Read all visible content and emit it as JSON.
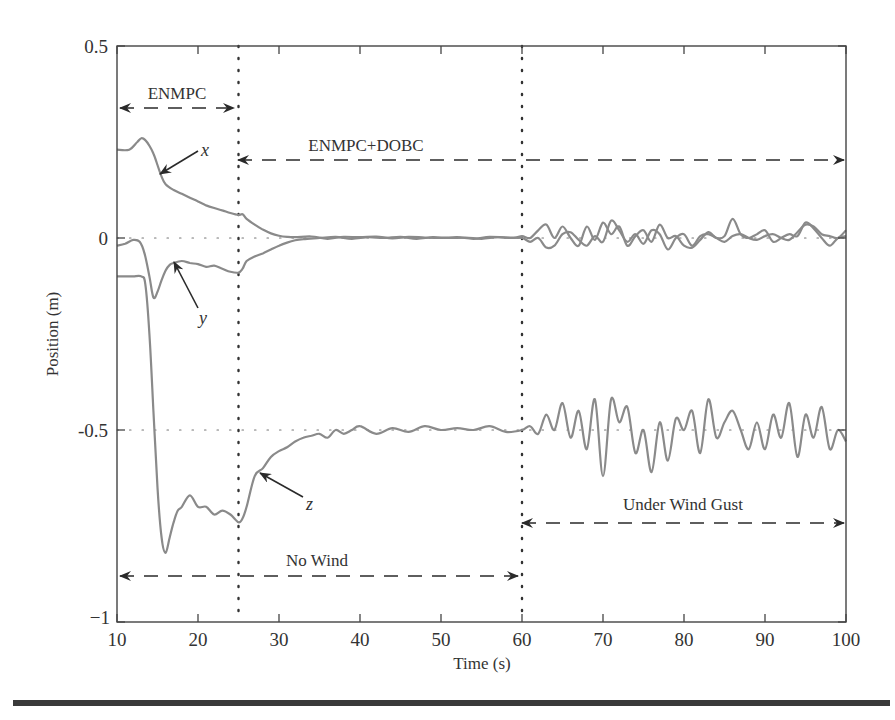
{
  "chart_data": {
    "type": "line",
    "title": "",
    "xlabel": "Time (s)",
    "ylabel": "Position (m)",
    "xlim": [
      10,
      100
    ],
    "ylim": [
      -1,
      0.5
    ],
    "xticks": [
      10,
      20,
      30,
      40,
      50,
      60,
      70,
      80,
      90,
      100
    ],
    "xtick_labels": [
      "10",
      "20",
      "30",
      "40",
      "50",
      "60",
      "70",
      "80",
      "90",
      "100"
    ],
    "yticks": [
      -1,
      -0.5,
      0,
      0.5
    ],
    "ytick_labels": [
      "−1",
      "-0.5",
      "0",
      "0.5"
    ],
    "grid": false,
    "reference_lines": [
      {
        "orientation": "horizontal",
        "value": 0,
        "style": "dotted"
      },
      {
        "orientation": "horizontal",
        "value": -0.5,
        "style": "dotted"
      },
      {
        "orientation": "vertical",
        "value": 25,
        "style": "dotted"
      },
      {
        "orientation": "vertical",
        "value": 60,
        "style": "dotted"
      }
    ],
    "series": [
      {
        "name": "x",
        "color": "#8a8a8a",
        "x": [
          10,
          11.5,
          12.5,
          13,
          13.5,
          14,
          14.5,
          15,
          15.5,
          16,
          17,
          18,
          19,
          20,
          21,
          22,
          23,
          24,
          25,
          25.5,
          26,
          27,
          28,
          29,
          30,
          31,
          32,
          34,
          36,
          38,
          40,
          42,
          44,
          46,
          48,
          50,
          52,
          54,
          56,
          58,
          60,
          61,
          62,
          63,
          64,
          65,
          66,
          67,
          68,
          69,
          70,
          71,
          72,
          73,
          74,
          75,
          76,
          77,
          78,
          79,
          80,
          81,
          82,
          83,
          84,
          85,
          86,
          87,
          88,
          89,
          90,
          91,
          92,
          93,
          94,
          95,
          96,
          97,
          98,
          99,
          100
        ],
        "values": [
          0.23,
          0.23,
          0.25,
          0.26,
          0.255,
          0.24,
          0.22,
          0.19,
          0.16,
          0.14,
          0.125,
          0.115,
          0.105,
          0.095,
          0.085,
          0.078,
          0.072,
          0.065,
          0.06,
          0.062,
          0.05,
          0.035,
          0.022,
          0.012,
          0.006,
          0.003,
          0.002,
          0.004,
          -0.002,
          0.003,
          0.002,
          0.004,
          -0.001,
          0.003,
          0.001,
          0.0,
          0.002,
          -0.002,
          0.003,
          0.001,
          0.0,
          -0.01,
          0.0,
          -0.025,
          -0.02,
          0.01,
          0.015,
          -0.005,
          -0.02,
          0.005,
          -0.01,
          0.045,
          0.02,
          -0.01,
          0.01,
          -0.015,
          0.02,
          0.01,
          -0.03,
          0.0,
          0.01,
          -0.02,
          0.005,
          0.01,
          0.0,
          -0.01,
          0.005,
          0.01,
          0.0,
          -0.005,
          0.005,
          0.01,
          0.0,
          -0.005,
          0.015,
          0.035,
          0.03,
          0.01,
          0.005,
          0.0,
          0.02
        ]
      },
      {
        "name": "y",
        "color": "#8a8a8a",
        "x": [
          10,
          11,
          12,
          12.8,
          13.4,
          14,
          14.5,
          15,
          15.5,
          16,
          16.5,
          17,
          18,
          19,
          20,
          21,
          22,
          23,
          24,
          25,
          25.5,
          26,
          27,
          28,
          29,
          30,
          31,
          32,
          33,
          35,
          37,
          39,
          41,
          43,
          45,
          47,
          49,
          51,
          53,
          55,
          57,
          59,
          60,
          61,
          62,
          63,
          64,
          65,
          66,
          67,
          68,
          69,
          70,
          71,
          72,
          73,
          74,
          75,
          76,
          77,
          78,
          79,
          80,
          81,
          82,
          83,
          84,
          85,
          86,
          87,
          88,
          89,
          90,
          91,
          92,
          93,
          94,
          95,
          96,
          97,
          98,
          99,
          100
        ],
        "values": [
          -0.02,
          -0.015,
          -0.005,
          -0.01,
          -0.04,
          -0.1,
          -0.155,
          -0.14,
          -0.11,
          -0.085,
          -0.07,
          -0.065,
          -0.06,
          -0.065,
          -0.068,
          -0.075,
          -0.072,
          -0.08,
          -0.088,
          -0.09,
          -0.08,
          -0.06,
          -0.048,
          -0.04,
          -0.03,
          -0.02,
          -0.012,
          -0.006,
          -0.003,
          0.0,
          0.003,
          -0.002,
          0.002,
          0.0,
          0.003,
          -0.002,
          0.002,
          0.0,
          0.001,
          -0.002,
          0.002,
          0.0,
          0.005,
          0.0,
          0.02,
          0.035,
          0.0,
          0.03,
          0.0,
          -0.02,
          0.03,
          -0.005,
          0.04,
          0.01,
          0.03,
          -0.02,
          0.005,
          0.02,
          -0.01,
          0.035,
          0.0,
          0.005,
          -0.02,
          -0.025,
          -0.005,
          0.015,
          0.0,
          0.005,
          0.05,
          0.01,
          0.0,
          0.01,
          0.02,
          -0.01,
          0.0,
          0.01,
          0.005,
          0.04,
          0.025,
          0.0,
          -0.02,
          0.0,
          0.005
        ]
      },
      {
        "name": "z",
        "color": "#8a8a8a",
        "x": [
          10,
          11,
          12,
          13,
          13.5,
          14,
          14.5,
          15,
          15.5,
          16,
          16.5,
          17,
          17.5,
          18,
          19,
          20,
          21,
          22,
          23,
          24,
          25,
          25.5,
          26,
          27,
          28,
          29,
          30,
          31,
          32,
          33,
          34,
          35,
          36,
          37,
          38,
          39,
          40,
          42,
          44,
          46,
          48,
          50,
          52,
          54,
          56,
          58,
          60,
          61,
          62,
          63,
          64,
          65,
          66,
          67,
          68,
          69,
          70,
          71,
          72,
          73,
          74,
          75,
          76,
          77,
          78,
          79,
          80,
          81,
          82,
          83,
          84,
          85,
          86,
          87,
          88,
          89,
          90,
          91,
          92,
          93,
          94,
          95,
          96,
          97,
          98,
          99,
          100
        ],
        "values": [
          -0.1,
          -0.1,
          -0.1,
          -0.1,
          -0.12,
          -0.25,
          -0.45,
          -0.65,
          -0.78,
          -0.82,
          -0.78,
          -0.74,
          -0.71,
          -0.7,
          -0.67,
          -0.7,
          -0.7,
          -0.72,
          -0.71,
          -0.72,
          -0.74,
          -0.73,
          -0.7,
          -0.62,
          -0.6,
          -0.57,
          -0.555,
          -0.545,
          -0.53,
          -0.52,
          -0.515,
          -0.51,
          -0.52,
          -0.5,
          -0.51,
          -0.5,
          -0.49,
          -0.51,
          -0.495,
          -0.505,
          -0.49,
          -0.5,
          -0.495,
          -0.5,
          -0.49,
          -0.505,
          -0.5,
          -0.49,
          -0.51,
          -0.46,
          -0.5,
          -0.43,
          -0.52,
          -0.45,
          -0.55,
          -0.42,
          -0.62,
          -0.42,
          -0.48,
          -0.44,
          -0.56,
          -0.5,
          -0.61,
          -0.48,
          -0.58,
          -0.47,
          -0.5,
          -0.45,
          -0.56,
          -0.42,
          -0.52,
          -0.48,
          -0.45,
          -0.5,
          -0.55,
          -0.48,
          -0.55,
          -0.46,
          -0.52,
          -0.43,
          -0.57,
          -0.46,
          -0.52,
          -0.44,
          -0.55,
          -0.5,
          -0.53
        ]
      }
    ],
    "annotations": [
      {
        "text": "ENMPC",
        "type": "span",
        "x_from": 10,
        "x_to": 25,
        "y": 0.34
      },
      {
        "text": "ENMPC+DOBC",
        "type": "span",
        "x_from": 25,
        "x_to": 100,
        "y": 0.205
      },
      {
        "text": "No Wind",
        "type": "span",
        "x_from": 10,
        "x_to": 60,
        "y": -0.87
      },
      {
        "text": "Under Wind Gust",
        "type": "span",
        "x_from": 60,
        "x_to": 100,
        "y": -0.73
      },
      {
        "text": "x",
        "type": "arrow-label",
        "points_to": [
          15.5,
          0.17
        ]
      },
      {
        "text": "y",
        "type": "arrow-label",
        "points_to": [
          17.5,
          -0.06
        ]
      },
      {
        "text": "z",
        "type": "arrow-label",
        "points_to": [
          27.5,
          -0.61
        ]
      }
    ]
  },
  "labels": {
    "xlabel": "Time (s)",
    "ylabel": "Position (m)",
    "span_enmpc": "ENMPC",
    "span_dobc": "ENMPC+DOBC",
    "span_nowind": "No Wind",
    "span_gust": "Under Wind Gust",
    "curve_x": "x",
    "curve_y": "y",
    "curve_z": "z"
  },
  "colors": {
    "curve": "#8a8a8a",
    "axis": "#444444",
    "annotation": "#2a2a2a",
    "rule": "#3a3a3a"
  }
}
